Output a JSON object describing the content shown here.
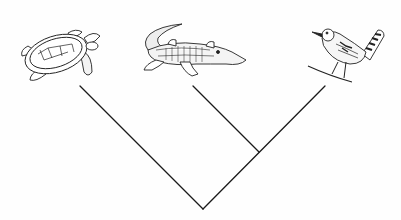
{
  "diagram": {
    "type": "cladogram",
    "line_color": "#1a1a1a",
    "taxa": [
      {
        "id": "turtle",
        "name": "sea-turtle",
        "tip": [
          80,
          86
        ],
        "icon": "turtle-icon"
      },
      {
        "id": "alligator",
        "name": "alligator",
        "tip": [
          193,
          86
        ],
        "icon": "alligator-icon"
      },
      {
        "id": "bird",
        "name": "wren-bird",
        "tip": [
          325,
          86
        ],
        "icon": "bird-icon"
      }
    ],
    "nodes": [
      {
        "id": "root",
        "pos": [
          203,
          209
        ],
        "children": [
          "turtle",
          "inner"
        ]
      },
      {
        "id": "inner",
        "pos": [
          259,
          152
        ],
        "children": [
          "alligator",
          "bird"
        ]
      }
    ]
  }
}
